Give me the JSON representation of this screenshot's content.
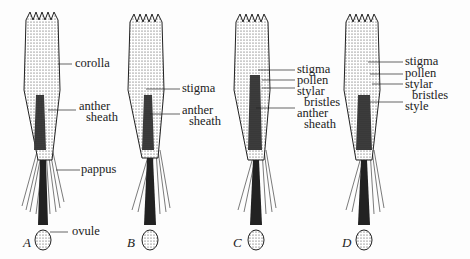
{
  "figure": {
    "panels": [
      {
        "letter": "A",
        "labels": [
          {
            "text": "corolla"
          },
          {
            "text": "anther"
          },
          {
            "text": "sheath"
          },
          {
            "text": "pappus"
          },
          {
            "text": "ovule"
          }
        ]
      },
      {
        "letter": "B",
        "labels": [
          {
            "text": "stigma"
          },
          {
            "text": "anther"
          },
          {
            "text": "sheath"
          }
        ]
      },
      {
        "letter": "C",
        "labels": [
          {
            "text": "stigma"
          },
          {
            "text": "pollen"
          },
          {
            "text": "stylar"
          },
          {
            "text": "bristles"
          },
          {
            "text": "anther"
          },
          {
            "text": "sheath"
          }
        ]
      },
      {
        "letter": "D",
        "labels": [
          {
            "text": "stigma"
          },
          {
            "text": "pollen"
          },
          {
            "text": "stylar"
          },
          {
            "text": "bristles"
          },
          {
            "text": "style"
          }
        ]
      }
    ],
    "colors": {
      "ink": "#1a1a1a",
      "background": "#fdfdfd"
    }
  }
}
